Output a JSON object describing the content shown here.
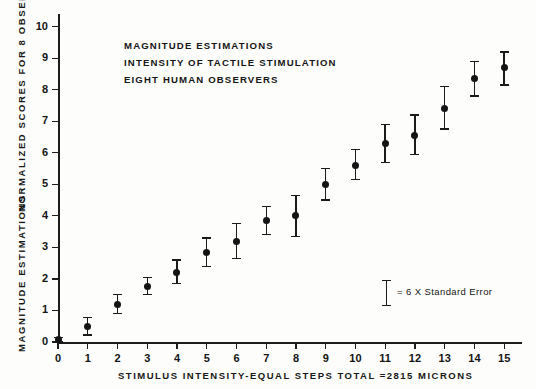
{
  "caption": {
    "line1": "MAGNITUDE ESTIMATIONS",
    "line2": "INTENSITY OF TACTILE STIMULATION",
    "line3": "EIGHT HUMAN OBSERVERS"
  },
  "legend": {
    "text": "= 6 X Standard Error"
  },
  "axis": {
    "y_title_top": "NORMALIZED   SCORES   FOR   8   OBSERVERS",
    "y_title_bottom": "MAGNITUDE   ESTIMATIONS",
    "x_title": "STIMULUS   INTENSITY-EQUAL  STEPS    TOTAL =2815   MICRONS"
  },
  "chart_data": {
    "type": "scatter",
    "title": "MAGNITUDE ESTIMATIONS INTENSITY OF TACTILE STIMULATION EIGHT HUMAN OBSERVERS",
    "xlabel": "STIMULUS INTENSITY-EQUAL STEPS TOTAL =2815 MICRONS",
    "ylabel": "MAGNITUDE ESTIMATIONS NORMALIZED SCORES FOR 8 OBSERVERS",
    "xlim": [
      0,
      15.6
    ],
    "ylim": [
      0,
      10.4
    ],
    "grid": false,
    "legend_position": "inside-lower-right",
    "xticks": [
      "0",
      "1",
      "2",
      "3",
      "4",
      "5",
      "6",
      "7",
      "8",
      "9",
      "10",
      "11",
      "12",
      "13",
      "14",
      "15"
    ],
    "yticks": [
      "0",
      "1",
      "2",
      "3",
      "4",
      "5",
      "6",
      "7",
      "8",
      "9",
      "10"
    ],
    "x": [
      0,
      1,
      2,
      3,
      4,
      5,
      6,
      7,
      8,
      9,
      10,
      11,
      12,
      13,
      14,
      15
    ],
    "values": [
      0.08,
      0.5,
      1.2,
      1.75,
      2.2,
      2.85,
      3.2,
      3.85,
      4.0,
      5.0,
      5.6,
      6.3,
      6.55,
      7.4,
      8.35,
      8.7
    ],
    "error_low": [
      0.02,
      0.22,
      0.9,
      1.5,
      1.85,
      2.4,
      2.65,
      3.4,
      3.35,
      4.5,
      5.15,
      5.7,
      5.95,
      6.75,
      7.8,
      8.15
    ],
    "error_high": [
      0.14,
      0.78,
      1.5,
      2.05,
      2.6,
      3.3,
      3.75,
      4.3,
      4.65,
      5.5,
      6.1,
      6.9,
      7.2,
      8.1,
      8.9,
      9.2
    ],
    "error_note": "= 6 X Standard Error"
  }
}
